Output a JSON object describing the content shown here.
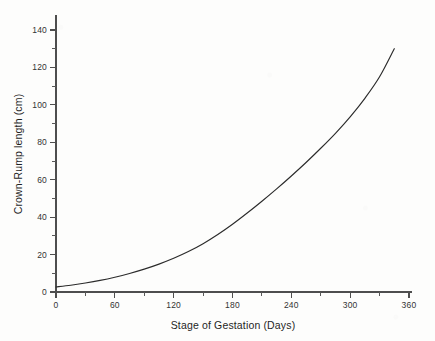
{
  "chart_data": {
    "type": "line",
    "title": "",
    "xlabel": "Stage of Gestation (Days)",
    "ylabel": "Crown-Rump length (cm)",
    "xlim": [
      0,
      360
    ],
    "ylim": [
      0,
      140
    ],
    "grid": false,
    "legend": "none",
    "x_ticks": [
      0,
      60,
      120,
      180,
      240,
      300,
      360
    ],
    "x_tick_labels": [
      "0",
      "60",
      "120",
      "180",
      "240",
      "300",
      "360"
    ],
    "x_minor_tick_interval": 30,
    "y_ticks": [
      0,
      20,
      40,
      60,
      80,
      100,
      120,
      140
    ],
    "y_tick_labels": [
      "0",
      "20",
      "40",
      "60",
      "80",
      "100",
      "120",
      "140"
    ],
    "y_minor_tick_interval": 10,
    "series": [
      {
        "name": "Crown-Rump length",
        "color": "#2b2b2b",
        "x": [
          0,
          15,
          30,
          45,
          60,
          75,
          90,
          105,
          120,
          135,
          150,
          165,
          180,
          195,
          210,
          225,
          240,
          255,
          270,
          285,
          300,
          315,
          330,
          345
        ],
        "values": [
          2.7,
          3.6,
          4.8,
          6.2,
          7.9,
          9.9,
          12.2,
          14.9,
          18.0,
          21.6,
          25.8,
          30.7,
          36.2,
          42.2,
          48.5,
          55.1,
          62.0,
          69.2,
          76.8,
          84.8,
          93.6,
          103.5,
          115.0,
          130.0
        ]
      }
    ]
  },
  "axis_geometry": {
    "origin_px": [
      56,
      292
    ],
    "x_axis_end_px": 412,
    "y_axis_top_px": 15
  },
  "colors": {
    "axis": "#4e4e4e",
    "curve": "#2b2b2b",
    "text": "#1f1f1f",
    "background": "#fdfdfc"
  }
}
